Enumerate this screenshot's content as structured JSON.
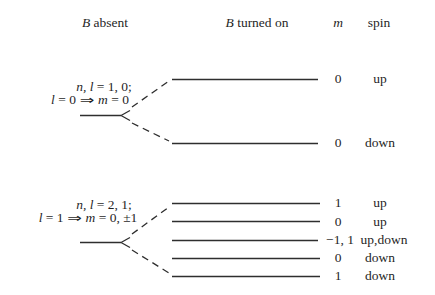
{
  "header": {
    "b_absent": {
      "var": "B",
      "rest": " absent"
    },
    "b_turned_on": {
      "var": "B",
      "rest": " turned on"
    },
    "m": "m",
    "spin": "spin"
  },
  "group_l0": {
    "line1": {
      "vars": "n, l",
      "eq": " = 1, 0;"
    },
    "line2": {
      "lhs_var": "l",
      "lhs_eq": " = 0",
      "arrow": "⇒",
      "rhs_var": "m",
      "rhs_eq": " = 0"
    },
    "levels": [
      {
        "m": "0",
        "spin": "up"
      },
      {
        "m": "0",
        "spin": "down"
      }
    ]
  },
  "group_l1": {
    "line1": {
      "vars": "n, l",
      "eq": " = 2, 1;"
    },
    "line2": {
      "lhs_var": "l",
      "lhs_eq": " = 1",
      "arrow": "⇒",
      "rhs_var": "m",
      "rhs_eq": " = 0, ±1"
    },
    "levels": [
      {
        "m": "1",
        "spin": "up"
      },
      {
        "m": "0",
        "spin": "up"
      },
      {
        "m": "−1, 1",
        "spin": "up,down"
      },
      {
        "m": "0",
        "spin": "down"
      },
      {
        "m": "1",
        "spin": "down"
      }
    ]
  },
  "colors": {
    "ink": "#1f1f1f",
    "line": "#2e2e2e",
    "background": "#ffffff"
  }
}
